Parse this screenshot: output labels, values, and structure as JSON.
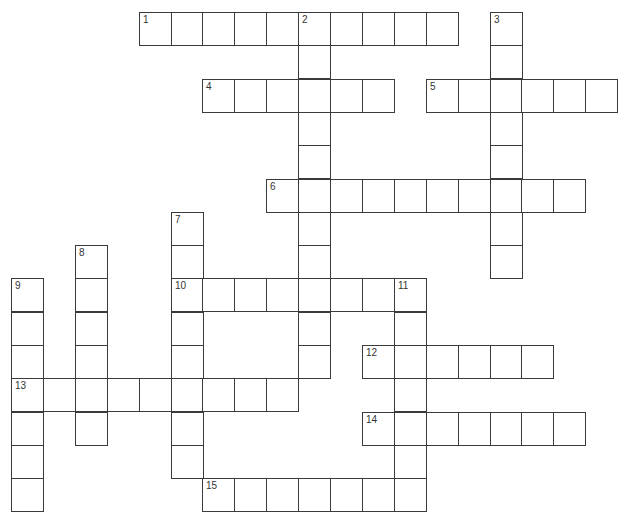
{
  "puzzle": {
    "type": "crossword",
    "grid": {
      "origin_x": 11,
      "origin_y": 12,
      "cell_w": 31.9,
      "cell_h": 33.3,
      "line_color": "#3a3a3a"
    },
    "entries": [
      {
        "number": 1,
        "direction": "across",
        "row": 0,
        "col": 4,
        "length": 10
      },
      {
        "number": 2,
        "direction": "down",
        "row": 0,
        "col": 9,
        "length": 11
      },
      {
        "number": 3,
        "direction": "down",
        "row": 0,
        "col": 15,
        "length": 8
      },
      {
        "number": 4,
        "direction": "across",
        "row": 2,
        "col": 6,
        "length": 6
      },
      {
        "number": 5,
        "direction": "across",
        "row": 2,
        "col": 13,
        "length": 6
      },
      {
        "number": 6,
        "direction": "across",
        "row": 5,
        "col": 8,
        "length": 10
      },
      {
        "number": 7,
        "direction": "down",
        "row": 6,
        "col": 5,
        "length": 8
      },
      {
        "number": 8,
        "direction": "down",
        "row": 7,
        "col": 2,
        "length": 6
      },
      {
        "number": 9,
        "direction": "down",
        "row": 8,
        "col": 0,
        "length": 7
      },
      {
        "number": 10,
        "direction": "across",
        "row": 8,
        "col": 5,
        "length": 8
      },
      {
        "number": 11,
        "direction": "down",
        "row": 8,
        "col": 12,
        "length": 7
      },
      {
        "number": 12,
        "direction": "across",
        "row": 10,
        "col": 11,
        "length": 6
      },
      {
        "number": 13,
        "direction": "across",
        "row": 11,
        "col": 0,
        "length": 9
      },
      {
        "number": 14,
        "direction": "across",
        "row": 12,
        "col": 11,
        "length": 7
      },
      {
        "number": 15,
        "direction": "across",
        "row": 14,
        "col": 6,
        "length": 7
      }
    ]
  }
}
